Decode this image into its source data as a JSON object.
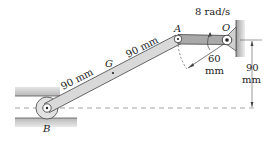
{
  "diagram": {
    "type": "mechanism",
    "points": {
      "A": "A",
      "O": "O",
      "G": "G",
      "B": "B"
    },
    "labels": {
      "angular_velocity": "8 rad/s",
      "link_AO_length_num": "60",
      "link_AO_length_unit": "mm",
      "AG_length": "90 mm",
      "GB_length": "90 mm",
      "height_num": "90",
      "height_unit": "mm"
    },
    "colors": {
      "link_fill": "#d9d9d9",
      "crank_fill": "#a9a9a9",
      "ground_fill": "#c8c8c8",
      "line": "#333333",
      "dashed": "#888888"
    }
  }
}
